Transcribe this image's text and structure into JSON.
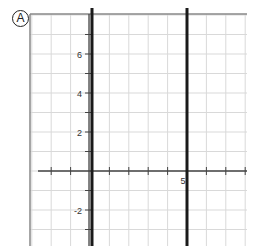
{
  "panel_label": "A",
  "colors": {
    "grid": "#d9d9d9",
    "frame": "#888888",
    "axis": "#444444",
    "line": "#1a1a1a",
    "text": "#333333"
  },
  "chart_data": {
    "type": "line",
    "title": "",
    "xlabel": "",
    "ylabel": "",
    "xlim": [
      -3,
      8
    ],
    "ylim": [
      -5,
      8
    ],
    "grid": true,
    "x_tick_labels": [
      {
        "value": 5,
        "label": "5"
      }
    ],
    "y_tick_labels": [
      {
        "value": 6,
        "label": "6"
      },
      {
        "value": 4,
        "label": "4"
      },
      {
        "value": 2,
        "label": "2"
      },
      {
        "value": -2,
        "label": "-2"
      }
    ],
    "series": [
      {
        "name": "vertical line x = 0",
        "type": "vertical",
        "x": 0
      },
      {
        "name": "vertical line x = 5",
        "type": "vertical",
        "x": 5
      }
    ],
    "legend": null,
    "annotations": [
      "Panel label: A (circled)"
    ]
  }
}
